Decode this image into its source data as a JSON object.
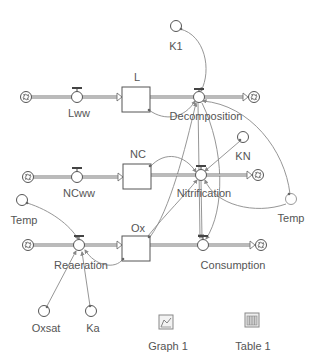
{
  "diagram": {
    "type": "stock-and-flow",
    "stocks": [
      {
        "id": "L",
        "label": "L"
      },
      {
        "id": "NC",
        "label": "NC"
      },
      {
        "id": "Ox",
        "label": "Ox"
      }
    ],
    "flows": [
      {
        "id": "Lww",
        "label": "Lww",
        "from": "cloud",
        "to": "L"
      },
      {
        "id": "Decomposition",
        "label": "Decomposition",
        "from": "L",
        "to": "cloud"
      },
      {
        "id": "NCww",
        "label": "NCww",
        "from": "cloud",
        "to": "NC"
      },
      {
        "id": "Nitrification",
        "label": "Nitrification",
        "from": "NC",
        "to": "cloud"
      },
      {
        "id": "Reaeration",
        "label": "Reaeration",
        "from": "cloud",
        "to": "Ox"
      },
      {
        "id": "Consumption",
        "label": "Consumption",
        "from": "Ox",
        "to": "cloud"
      }
    ],
    "converters": [
      {
        "id": "K1",
        "label": "K1"
      },
      {
        "id": "KN",
        "label": "KN"
      },
      {
        "id": "Temp_right",
        "label": "Temp"
      },
      {
        "id": "Temp_left",
        "label": "Temp"
      },
      {
        "id": "Oxsat",
        "label": "Oxsat"
      },
      {
        "id": "Ka",
        "label": "Ka"
      }
    ],
    "connectors": [
      {
        "from": "K1",
        "to": "Decomposition"
      },
      {
        "from": "L",
        "to": "Decomposition"
      },
      {
        "from": "Temp_right",
        "to": "Decomposition"
      },
      {
        "from": "KN",
        "to": "Nitrification"
      },
      {
        "from": "NC",
        "to": "Nitrification"
      },
      {
        "from": "Temp_right",
        "to": "Nitrification"
      },
      {
        "from": "Decomposition",
        "to": "Consumption"
      },
      {
        "from": "Nitrification",
        "to": "Consumption"
      },
      {
        "from": "Temp_left",
        "to": "Reaeration"
      },
      {
        "from": "Oxsat",
        "to": "Reaeration"
      },
      {
        "from": "Ka",
        "to": "Reaeration"
      },
      {
        "from": "Ox",
        "to": "Reaeration"
      },
      {
        "from": "Ox",
        "to": "Decomposition"
      }
    ]
  },
  "labels": {
    "K1": "K1",
    "L": "L",
    "Lww": "Lww",
    "Decomposition": "Decomposition",
    "NC": "NC",
    "KN": "KN",
    "NCww": "NCww",
    "Nitrification": "Nitrification",
    "Temp_right": "Temp",
    "Temp_left": "Temp",
    "Ox": "Ox",
    "Reaeration": "Reaeration",
    "Consumption": "Consumption",
    "Oxsat": "Oxsat",
    "Ka": "Ka"
  },
  "tools": {
    "graph_label": "Graph 1",
    "table_label": "Table 1"
  },
  "colors": {
    "pipe": "#666666",
    "connector": "#888888",
    "outline": "#555555",
    "text": "#555555"
  }
}
